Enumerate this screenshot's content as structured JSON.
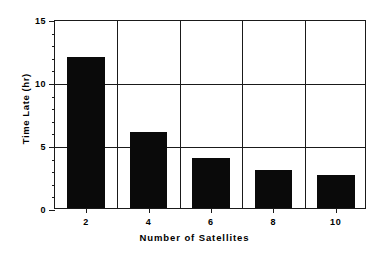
{
  "chart_data": {
    "type": "bar",
    "title": "",
    "xlabel": "Number of Satellites",
    "ylabel": "Time Late (hr)",
    "categories": [
      "2",
      "4",
      "6",
      "8",
      "10"
    ],
    "values": [
      12,
      6,
      4,
      3,
      2.6
    ],
    "series": [
      {
        "name": "Time Late",
        "values": [
          12,
          6,
          4,
          3,
          2.6
        ]
      }
    ],
    "ylim": [
      0,
      15
    ],
    "y_major_ticks": [
      "0",
      "5",
      "10",
      "15"
    ],
    "y_major_tick_values": [
      0,
      5,
      10,
      15
    ],
    "y_minor_tick_interval": 1,
    "x_tick_labels": [
      "2",
      "4",
      "6",
      "8",
      "10"
    ],
    "grid": "major-y-and-category-separators",
    "legend": "none",
    "bar_color": "#0a0a0a",
    "axis_color": "#1a1a1a",
    "background_color": "#ffffff"
  }
}
